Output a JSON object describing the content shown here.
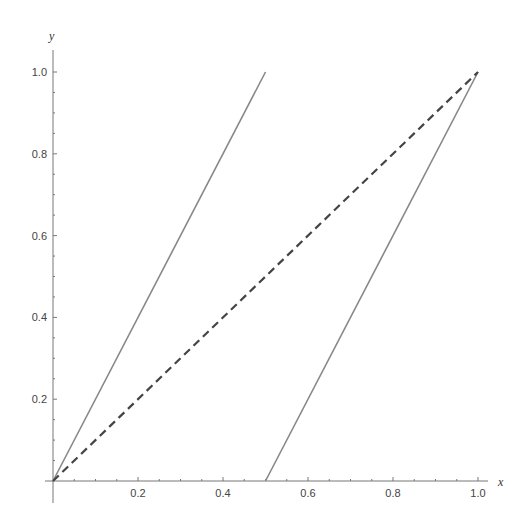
{
  "chart_data": {
    "type": "line",
    "title": "",
    "xlabel": "x",
    "ylabel": "y",
    "xlim": [
      0,
      1.0
    ],
    "ylim": [
      0,
      1.0
    ],
    "x_ticks": [
      "0.2",
      "0.4",
      "0.6",
      "0.8",
      "1.0"
    ],
    "y_ticks": [
      "0.2",
      "0.4",
      "0.6",
      "0.8",
      "1.0"
    ],
    "grid": false,
    "series": [
      {
        "name": "line-left",
        "style": "solid",
        "color": "#888888",
        "x": [
          0,
          0.5
        ],
        "y": [
          0,
          1.0
        ]
      },
      {
        "name": "line-right",
        "style": "solid",
        "color": "#888888",
        "x": [
          0.5,
          1.0
        ],
        "y": [
          0,
          1.0
        ]
      },
      {
        "name": "diagonal",
        "style": "dashed",
        "color": "#444444",
        "x": [
          0,
          1.0
        ],
        "y": [
          0,
          1.0
        ]
      }
    ]
  }
}
